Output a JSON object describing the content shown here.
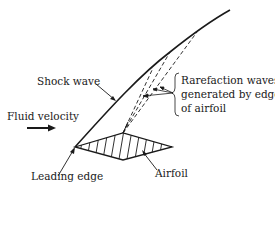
{
  "diagram": {
    "type": "supersonic-airfoil-shock",
    "labels": {
      "shock_wave": "Shock wave",
      "fluid_velocity": "Fluid velocity",
      "leading_edge": "Leading edge",
      "airfoil": "Airfoil",
      "rarefaction_line1": "Rarefaction waves",
      "rarefaction_line2": "generated by edge",
      "rarefaction_line3": "of airfoil"
    },
    "colors": {
      "ink": "#1a1a1a",
      "background": "#ffffff"
    }
  }
}
